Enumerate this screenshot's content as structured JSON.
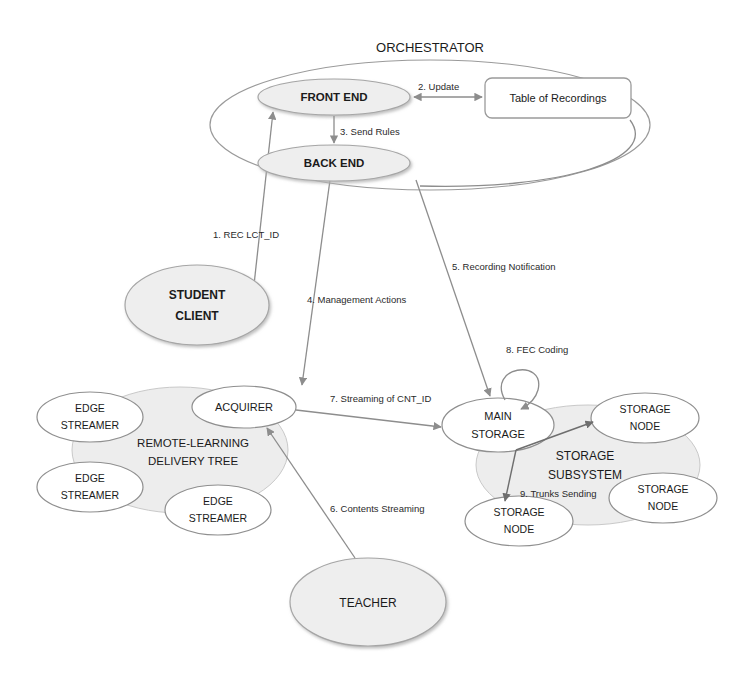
{
  "diagram": {
    "title_top": "ORCHESTRATOR",
    "nodes": {
      "front_end": "FRONT END",
      "back_end": "BACK END",
      "table_of_recordings": "Table of Recordings",
      "student_client_line1": "STUDENT",
      "student_client_line2": "CLIENT",
      "teacher": "TEACHER",
      "acquirer": "ACQUIRER",
      "edge_streamer_1_line1": "EDGE",
      "edge_streamer_1_line2": "STREAMER",
      "edge_streamer_2_line1": "EDGE",
      "edge_streamer_2_line2": "STREAMER",
      "edge_streamer_3_line1": "EDGE",
      "edge_streamer_3_line2": "STREAMER",
      "delivery_tree_line1": "REMOTE-LEARNING",
      "delivery_tree_line2": "DELIVERY TREE",
      "main_storage_line1": "MAIN",
      "main_storage_line2": "STORAGE",
      "storage_subsystem_line1": "STORAGE",
      "storage_subsystem_line2": "SUBSYSTEM",
      "storage_node_1_line1": "STORAGE",
      "storage_node_1_line2": "NODE",
      "storage_node_2_line1": "STORAGE",
      "storage_node_2_line2": "NODE",
      "storage_node_3_line1": "STORAGE",
      "storage_node_3_line2": "NODE"
    },
    "edges": {
      "e1": "1. REC  LCT_ID",
      "e2": "2. Update",
      "e3": "3. Send Rules",
      "e4": "4. Management Actions",
      "e5": "5. Recording Notification",
      "e6": "6. Contents Streaming",
      "e7": "7. Streaming of CNT_ID",
      "e8": "8. FEC Coding",
      "e9": "9. Trunks Sending"
    },
    "colors": {
      "line": "#8d8d8d",
      "shaded_fill": "#eeeeee",
      "cloud_fill": "#ededed",
      "text": "#1b1b1b",
      "background": "#ffffff"
    }
  }
}
